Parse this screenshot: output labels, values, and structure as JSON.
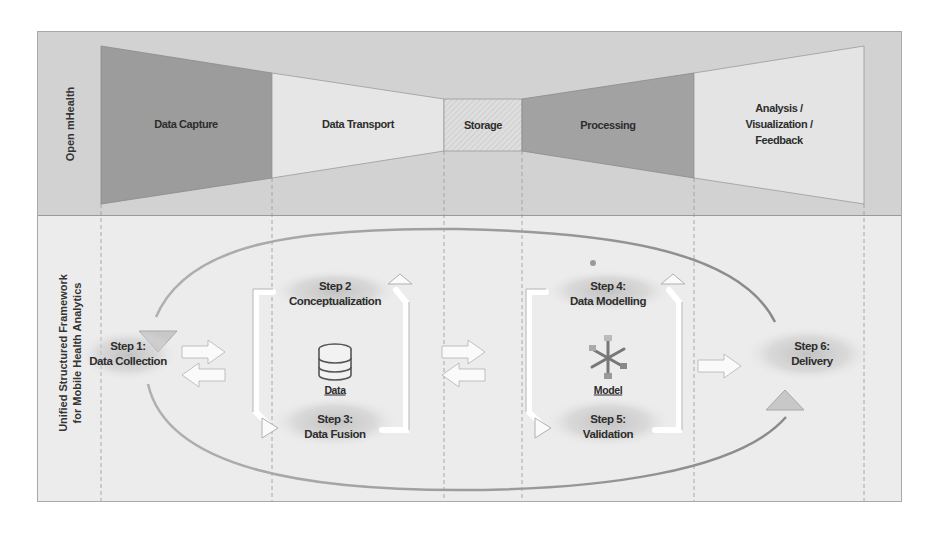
{
  "top_section": {
    "side_label": "Open mHealth",
    "stages": [
      {
        "label": "Data Capture",
        "fill": "#9c9c9c"
      },
      {
        "label": "Data Transport",
        "fill": "#e6e6e6"
      },
      {
        "label": "Storage",
        "fill": "#dcdcdc",
        "pattern": "hatched"
      },
      {
        "label": "Processing",
        "fill": "#a2a2a2"
      },
      {
        "label": "Analysis / Visualization / Feedback",
        "lines": [
          "Analysis /",
          "Visualization /",
          "Feedback"
        ],
        "fill": "#e4e4e4"
      }
    ]
  },
  "bottom_section": {
    "side_label_line1": "Unified Structured Framework",
    "side_label_line2": "for Mobile Health Analytics",
    "steps": [
      {
        "id": 1,
        "line1": "Step 1:",
        "line2": "Data Collection"
      },
      {
        "id": 2,
        "line1": "Step 2",
        "line2": "Conceptualization"
      },
      {
        "id": 3,
        "line1": "Step 3:",
        "line2": "Data Fusion"
      },
      {
        "id": 4,
        "line1": "Step 4:",
        "line2": "Data Modelling"
      },
      {
        "id": 5,
        "line1": "Step 5:",
        "line2": "Validation"
      },
      {
        "id": 6,
        "line1": "Step 6:",
        "line2": "Delivery"
      }
    ],
    "icons": [
      {
        "name": "database-icon",
        "caption": "Data"
      },
      {
        "name": "model-icon",
        "caption": "Model"
      }
    ]
  }
}
